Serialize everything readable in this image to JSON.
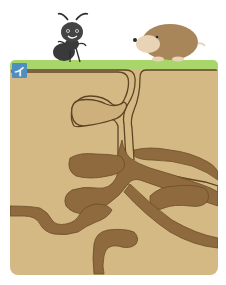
{
  "figure": {
    "option_label": "イ",
    "characters": [
      {
        "name": "ant",
        "color": "#3a3a3a"
      },
      {
        "name": "mole",
        "color": "#a8865a"
      }
    ],
    "colors": {
      "background": "#ffffff",
      "grass": "#a8d66a",
      "soil": "#d4b985",
      "tunnel": "#8e6a3e",
      "tunnel_outline": "#5e4424",
      "label_bg": "#4f8fc0"
    }
  }
}
